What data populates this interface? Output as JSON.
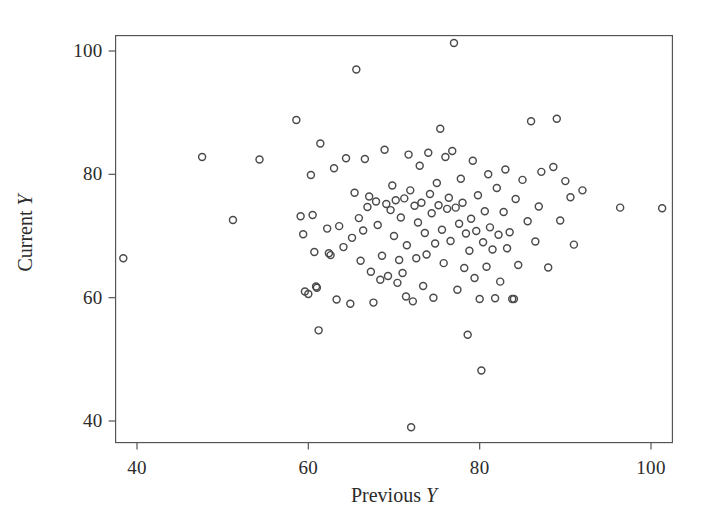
{
  "chart_data": {
    "type": "scatter",
    "title": "",
    "xlabel": "Previous Y",
    "ylabel": "Current Y",
    "xlabel_prefix": "Previous ",
    "xlabel_var": "Y",
    "ylabel_prefix": "Current ",
    "ylabel_var": "Y",
    "xlim": [
      37.5,
      102.5
    ],
    "ylim": [
      36.5,
      102.5
    ],
    "xticks": [
      40,
      60,
      80,
      100
    ],
    "yticks": [
      40,
      60,
      80,
      100
    ],
    "xtick_labels": [
      "40",
      "60",
      "80",
      "100"
    ],
    "ytick_labels": [
      "40",
      "60",
      "80",
      "100"
    ],
    "grid": false,
    "legend": null,
    "marker": "open-circle",
    "marker_color": "#4a4a4a",
    "marker_size": 7,
    "frame_color": "#555555",
    "background": "#ffffff",
    "n_points": 131,
    "points": [
      [
        38.4,
        66.4
      ],
      [
        47.6,
        82.8
      ],
      [
        51.2,
        72.6
      ],
      [
        54.3,
        82.4
      ],
      [
        58.6,
        88.8
      ],
      [
        59.1,
        73.2
      ],
      [
        59.4,
        70.3
      ],
      [
        59.6,
        61.0
      ],
      [
        60.0,
        60.6
      ],
      [
        60.3,
        79.9
      ],
      [
        60.5,
        73.4
      ],
      [
        60.7,
        67.4
      ],
      [
        60.9,
        61.8
      ],
      [
        61.0,
        61.6
      ],
      [
        61.2,
        54.7
      ],
      [
        61.4,
        85.0
      ],
      [
        62.2,
        71.2
      ],
      [
        62.4,
        67.2
      ],
      [
        62.6,
        66.9
      ],
      [
        63.0,
        81.0
      ],
      [
        63.3,
        59.7
      ],
      [
        63.6,
        71.6
      ],
      [
        64.1,
        68.2
      ],
      [
        64.4,
        82.6
      ],
      [
        64.9,
        59.0
      ],
      [
        65.1,
        69.7
      ],
      [
        65.4,
        77.0
      ],
      [
        65.6,
        97.0
      ],
      [
        65.9,
        72.9
      ],
      [
        66.1,
        66.0
      ],
      [
        66.4,
        70.9
      ],
      [
        66.6,
        82.5
      ],
      [
        66.9,
        74.7
      ],
      [
        67.1,
        76.4
      ],
      [
        67.3,
        64.2
      ],
      [
        67.6,
        59.2
      ],
      [
        67.9,
        75.6
      ],
      [
        68.1,
        71.8
      ],
      [
        68.4,
        62.9
      ],
      [
        68.6,
        66.8
      ],
      [
        68.9,
        84.0
      ],
      [
        69.1,
        75.2
      ],
      [
        69.3,
        63.5
      ],
      [
        69.6,
        74.2
      ],
      [
        69.8,
        78.2
      ],
      [
        70.0,
        70.0
      ],
      [
        70.2,
        75.8
      ],
      [
        70.4,
        62.4
      ],
      [
        70.6,
        66.1
      ],
      [
        70.8,
        73.0
      ],
      [
        71.0,
        64.0
      ],
      [
        71.2,
        76.1
      ],
      [
        71.4,
        60.2
      ],
      [
        71.5,
        68.5
      ],
      [
        71.7,
        83.2
      ],
      [
        71.9,
        77.4
      ],
      [
        72.0,
        39.0
      ],
      [
        72.2,
        59.4
      ],
      [
        72.4,
        74.9
      ],
      [
        72.6,
        66.4
      ],
      [
        72.8,
        72.2
      ],
      [
        73.0,
        81.4
      ],
      [
        73.2,
        75.4
      ],
      [
        73.4,
        61.9
      ],
      [
        73.6,
        70.5
      ],
      [
        73.8,
        67.0
      ],
      [
        74.0,
        83.5
      ],
      [
        74.2,
        76.8
      ],
      [
        74.4,
        73.7
      ],
      [
        74.6,
        60.0
      ],
      [
        74.8,
        68.8
      ],
      [
        75.0,
        78.6
      ],
      [
        75.2,
        75.0
      ],
      [
        75.4,
        87.4
      ],
      [
        75.6,
        71.0
      ],
      [
        75.8,
        65.6
      ],
      [
        76.0,
        82.8
      ],
      [
        76.2,
        74.4
      ],
      [
        76.4,
        76.2
      ],
      [
        76.6,
        69.2
      ],
      [
        76.8,
        83.8
      ],
      [
        77.0,
        101.3
      ],
      [
        77.2,
        74.6
      ],
      [
        77.4,
        61.3
      ],
      [
        77.6,
        72.0
      ],
      [
        77.8,
        79.3
      ],
      [
        78.0,
        75.4
      ],
      [
        78.2,
        64.8
      ],
      [
        78.4,
        70.4
      ],
      [
        78.6,
        54.0
      ],
      [
        78.8,
        67.6
      ],
      [
        79.0,
        72.8
      ],
      [
        79.2,
        82.2
      ],
      [
        79.4,
        63.2
      ],
      [
        79.6,
        70.8
      ],
      [
        79.8,
        76.6
      ],
      [
        80.0,
        59.8
      ],
      [
        80.2,
        48.2
      ],
      [
        80.4,
        69.0
      ],
      [
        80.6,
        74.0
      ],
      [
        80.8,
        65.0
      ],
      [
        81.0,
        80.0
      ],
      [
        81.2,
        71.4
      ],
      [
        81.5,
        67.8
      ],
      [
        81.8,
        59.9
      ],
      [
        82.0,
        77.8
      ],
      [
        82.2,
        70.2
      ],
      [
        82.4,
        62.6
      ],
      [
        82.8,
        73.9
      ],
      [
        83.0,
        80.8
      ],
      [
        83.2,
        68.0
      ],
      [
        83.5,
        70.6
      ],
      [
        83.8,
        59.8
      ],
      [
        84.0,
        59.8
      ],
      [
        84.2,
        76.0
      ],
      [
        84.5,
        65.3
      ],
      [
        85.0,
        79.1
      ],
      [
        85.6,
        72.4
      ],
      [
        86.0,
        88.6
      ],
      [
        86.5,
        69.1
      ],
      [
        86.9,
        74.8
      ],
      [
        87.2,
        80.4
      ],
      [
        88.0,
        64.9
      ],
      [
        88.6,
        81.2
      ],
      [
        89.0,
        89.0
      ],
      [
        89.4,
        72.5
      ],
      [
        90.0,
        78.9
      ],
      [
        90.6,
        76.3
      ],
      [
        91.0,
        68.6
      ],
      [
        92.0,
        77.4
      ],
      [
        96.4,
        74.6
      ],
      [
        101.3,
        74.5
      ]
    ]
  }
}
